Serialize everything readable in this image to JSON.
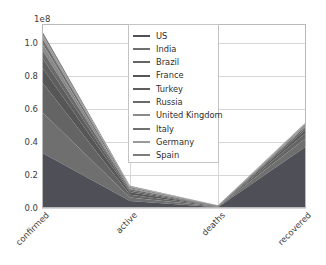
{
  "chart_data": {
    "type": "area",
    "stacked": true,
    "title": "",
    "xlabel": "",
    "ylabel": "",
    "categories": [
      "confirmed",
      "active",
      "deaths",
      "recovered"
    ],
    "x_tick_labels": [
      "confirmed",
      "active",
      "deaths",
      "recovered"
    ],
    "x_tick_rotation": -45,
    "y_offset_label": "1e8",
    "y_scale": 100000000,
    "y_tick_labels": [
      "0.0",
      "0.2",
      "0.4",
      "0.6",
      "0.8",
      "1.0"
    ],
    "y_tick_values": [
      0.0,
      0.2,
      0.4,
      0.6,
      0.8,
      1.0
    ],
    "ylim": [
      0.0,
      1.115
    ],
    "xlim": [
      0,
      3
    ],
    "grid": true,
    "grid_axis": "both",
    "legend_position": "upper center inside",
    "series": [
      {
        "name": "US",
        "color": "#4f4f58",
        "values": [
          0.335,
          0.042,
          0.005,
          0.372
        ]
      },
      {
        "name": "India",
        "color": "#6f6f6f",
        "values": [
          0.247,
          0.021,
          0.003,
          0.052
        ]
      },
      {
        "name": "Brazil",
        "color": "#646464",
        "values": [
          0.181,
          0.018,
          0.002,
          0.032
        ]
      },
      {
        "name": "France",
        "color": "#565656",
        "values": [
          0.09,
          0.014,
          0.001,
          0.019
        ]
      },
      {
        "name": "Turkey",
        "color": "#5e5e5e",
        "values": [
          0.06,
          0.01,
          0.001,
          0.013
        ]
      },
      {
        "name": "Russia",
        "color": "#6a6a6a",
        "values": [
          0.048,
          0.008,
          0.001,
          0.009
        ]
      },
      {
        "name": "United Kingdom",
        "color": "#8a8a8a",
        "values": [
          0.04,
          0.007,
          0.001,
          0.007
        ]
      },
      {
        "name": "Italy",
        "color": "#707070",
        "values": [
          0.03,
          0.006,
          0.001,
          0.006
        ]
      },
      {
        "name": "Germany",
        "color": "#9a9a9a",
        "values": [
          0.025,
          0.005,
          0.001,
          0.005
        ]
      },
      {
        "name": "Spain",
        "color": "#7c7c7c",
        "values": [
          0.018,
          0.004,
          0.001,
          0.004
        ]
      }
    ]
  },
  "legend": {
    "items": [
      {
        "label": "US"
      },
      {
        "label": "India"
      },
      {
        "label": "Brazil"
      },
      {
        "label": "France"
      },
      {
        "label": "Turkey"
      },
      {
        "label": "Russia"
      },
      {
        "label": "United Kingdom"
      },
      {
        "label": "Italy"
      },
      {
        "label": "Germany"
      },
      {
        "label": "Spain"
      }
    ]
  }
}
